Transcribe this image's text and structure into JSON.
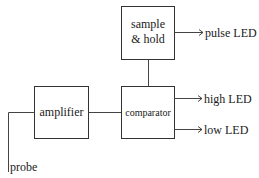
{
  "diagram": {
    "type": "block-diagram",
    "blocks": {
      "sample_hold": {
        "line1": "sample",
        "line2": "& hold"
      },
      "amplifier": {
        "label": "amplifier"
      },
      "comparator": {
        "label": "comparator"
      }
    },
    "outputs": {
      "pulse": "pulse LED",
      "high": "high LED",
      "low": "low LED"
    },
    "input": {
      "probe": "probe"
    },
    "connections": [
      {
        "from": "probe",
        "to": "amplifier"
      },
      {
        "from": "amplifier",
        "to": "comparator"
      },
      {
        "from": "comparator",
        "to": "sample_hold"
      },
      {
        "from": "sample_hold",
        "to": "pulse LED"
      },
      {
        "from": "comparator",
        "to": "high LED"
      },
      {
        "from": "comparator",
        "to": "low LED"
      }
    ],
    "colors": {
      "stroke": "#333333",
      "text": "#1a1a1a",
      "background": "#ffffff"
    }
  }
}
